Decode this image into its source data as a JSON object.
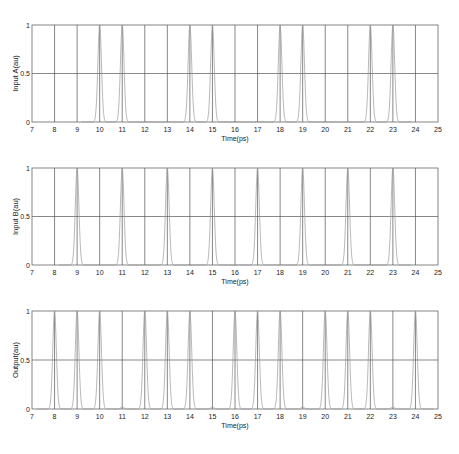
{
  "chart_data": [
    {
      "type": "line",
      "panel": "input-a",
      "title": "",
      "xlabel": "Time(ps)",
      "ylabel": "Input A(au)",
      "xlim": [
        7,
        25
      ],
      "ylim": [
        0,
        1
      ],
      "xticks": [
        "7",
        "8",
        "9",
        "10",
        "11",
        "12",
        "13",
        "14",
        "15",
        "16",
        "17",
        "18",
        "19",
        "20",
        "21",
        "22",
        "23",
        "24",
        "25"
      ],
      "yticks": [
        "0",
        "0.5",
        "1"
      ],
      "grid": true,
      "pulse_width_ps": 0.08,
      "peaks": [
        10,
        11,
        14,
        15,
        18,
        19,
        22,
        23
      ],
      "peak_amplitude": 1
    },
    {
      "type": "line",
      "panel": "input-b",
      "title": "",
      "xlabel": "Time(ps)",
      "ylabel": "Input B(au)",
      "xlim": [
        7,
        25
      ],
      "ylim": [
        0,
        1
      ],
      "xticks": [
        "7",
        "8",
        "9",
        "10",
        "11",
        "12",
        "13",
        "14",
        "15",
        "16",
        "17",
        "18",
        "19",
        "20",
        "21",
        "22",
        "23",
        "24",
        "25"
      ],
      "yticks": [
        "0",
        "0.5",
        "1"
      ],
      "grid": true,
      "pulse_width_ps": 0.08,
      "peaks": [
        9,
        11,
        13,
        15,
        17,
        19,
        21,
        23
      ],
      "peak_amplitude": 1
    },
    {
      "type": "line",
      "panel": "output",
      "title": "",
      "xlabel": "Time(ps)",
      "ylabel": "Output(au)",
      "xlim": [
        7,
        25
      ],
      "ylim": [
        0,
        1
      ],
      "xticks": [
        "7",
        "8",
        "9",
        "10",
        "11",
        "12",
        "13",
        "14",
        "15",
        "16",
        "17",
        "18",
        "19",
        "20",
        "21",
        "22",
        "23",
        "24",
        "25"
      ],
      "yticks": [
        "0",
        "0.5",
        "1"
      ],
      "grid": true,
      "pulse_width_ps": 0.08,
      "peaks": [
        8,
        9,
        10,
        12,
        13,
        14,
        16,
        17,
        18,
        20,
        21,
        22,
        24
      ],
      "peak_amplitude": 1,
      "residual_bumps": [
        11,
        15,
        19,
        23
      ],
      "residual_amplitude": 0.02
    }
  ],
  "colors": {
    "trace": "#9a9a9a",
    "grid": "#555555",
    "axes": "#666666"
  }
}
